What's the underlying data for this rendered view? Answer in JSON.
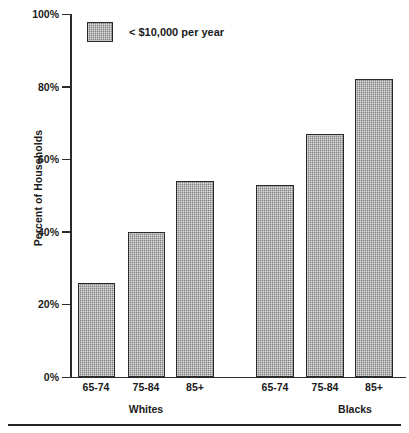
{
  "chart_data": {
    "type": "bar",
    "title": "",
    "subtitle": "",
    "xlabel": "",
    "ylabel": "Percent of Households",
    "ylim": [
      0,
      100
    ],
    "y_unit": "%",
    "grid": false,
    "legend_position": "top-left",
    "legend": [
      "< $10,000 per year"
    ],
    "y_ticks": [
      {
        "value": 100,
        "label": "100%"
      },
      {
        "value": 80,
        "label": "80%"
      },
      {
        "value": 60,
        "label": "60%"
      },
      {
        "value": 40,
        "label": "40%"
      },
      {
        "value": 20,
        "label": "20%"
      },
      {
        "value": 0,
        "label": "0%"
      }
    ],
    "groups": [
      {
        "name": "Whites",
        "categories": [
          "65-74",
          "75-84",
          "85+"
        ],
        "values": [
          26,
          40,
          54
        ]
      },
      {
        "name": "Blacks",
        "categories": [
          "65-74",
          "75-84",
          "85+"
        ],
        "values": [
          53,
          67,
          82
        ]
      }
    ],
    "categories": [
      "65-74",
      "75-84",
      "85+",
      "65-74",
      "75-84",
      "85+"
    ],
    "values": [
      26,
      40,
      54,
      53,
      67,
      82
    ],
    "series": [
      {
        "name": "< $10,000 per year",
        "values": [
          26,
          40,
          54,
          53,
          67,
          82
        ],
        "color": "#9a9a9a"
      }
    ],
    "colors": {
      "bar_fill": "#9a9a9a",
      "bar_edge": "#2a2a2a",
      "axis": "#2b2b2b",
      "text": "#1a1a1a",
      "background": "#ffffff"
    }
  }
}
